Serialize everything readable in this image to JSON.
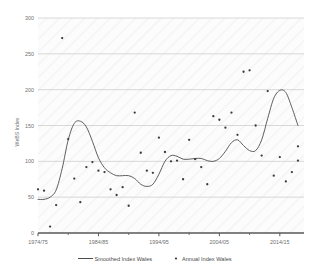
{
  "chart_data": {
    "type": "scatter",
    "title": "",
    "xlabel": "",
    "ylabel": "WeBS Index",
    "ylim": [
      0,
      300
    ],
    "ytick_values": [
      0,
      50,
      100,
      150,
      200,
      250,
      300
    ],
    "ytick_labels": [
      "0",
      "50",
      "100",
      "150",
      "200",
      "250",
      "300"
    ],
    "xtick_labels": [
      "1974/75",
      "1984/85",
      "1994/95",
      "2004/05",
      "2014/15"
    ],
    "xtick_values": [
      1974,
      1984,
      1994,
      2004,
      2014
    ],
    "xlim": [
      1974,
      2018
    ],
    "grid": "horizontal",
    "legend_position": "bottom",
    "series": [
      {
        "name": "Smoothed Index Wales",
        "type": "line",
        "color": "#4d4d4d",
        "x": [
          1974,
          1975,
          1976,
          1977,
          1978,
          1979,
          1980,
          1981,
          1982,
          1983,
          1984,
          1985,
          1986,
          1987,
          1988,
          1989,
          1990,
          1991,
          1992,
          1993,
          1994,
          1995,
          1996,
          1997,
          1998,
          1999,
          2000,
          2001,
          2002,
          2003,
          2004,
          2005,
          2006,
          2007,
          2008,
          2009,
          2010,
          2011,
          2012,
          2013,
          2014,
          2015,
          2016,
          2017
        ],
        "values": [
          47,
          47,
          50,
          60,
          90,
          130,
          153,
          156,
          148,
          128,
          105,
          91,
          84,
          80,
          80,
          80,
          76,
          68,
          65,
          68,
          82,
          100,
          108,
          107,
          103,
          103,
          104,
          104,
          101,
          100,
          104,
          114,
          126,
          130,
          122,
          115,
          115,
          130,
          160,
          188,
          199,
          196,
          175,
          150
        ]
      },
      {
        "name": "Annual Index Wales",
        "type": "scatter",
        "color": "#3a3a3a",
        "x": [
          1974,
          1975,
          1976,
          1977,
          1978,
          1979,
          1980,
          1981,
          1982,
          1983,
          1984,
          1985,
          1986,
          1987,
          1988,
          1989,
          1990,
          1991,
          1992,
          1993,
          1994,
          1995,
          1996,
          1997,
          1998,
          1999,
          2000,
          2001,
          2002,
          2003,
          2004,
          2005,
          2006,
          2007,
          2008,
          2009,
          2010,
          2011,
          2012,
          2013,
          2014,
          2015,
          2016,
          2017
        ],
        "values": [
          61,
          59,
          9,
          39,
          272,
          131,
          76,
          43,
          92,
          99,
          87,
          85,
          61,
          53,
          64,
          38,
          168,
          112,
          87,
          84,
          133,
          113,
          100,
          101,
          75,
          130,
          103,
          92,
          68,
          163,
          158,
          147,
          168,
          137,
          225,
          227,
          150,
          108,
          198,
          80,
          106,
          72,
          85,
          121
        ]
      }
    ],
    "annual_extra_points": [
      {
        "x": 2017,
        "y": 101
      }
    ]
  },
  "legend": {
    "items": [
      {
        "label": "Smoothed Index Wales",
        "marker": "line",
        "color": "#4d4d4d"
      },
      {
        "label": "Annual Index Wales",
        "marker": "dot",
        "color": "#3a3a3a"
      }
    ]
  },
  "colors": {
    "background": "#ffffff",
    "plot_background": "#fbfbfb",
    "gridline": "#c9c9c9",
    "axis": "#595959",
    "line": "#4d4d4d",
    "marker": "#3a3a3a",
    "tick_text": "#6f6f6f"
  }
}
